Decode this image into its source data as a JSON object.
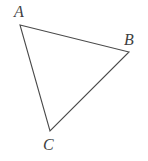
{
  "figure": {
    "kind": "geometry-diagram",
    "shape_name": "triangle",
    "background_color": "#ffffff",
    "stroke_color": "#4a4a4a",
    "stroke_width": 1.1,
    "label_color": "#3f3f3f",
    "canvas": {
      "width": 148,
      "height": 161
    },
    "vertices": [
      {
        "id": "A",
        "label": "A",
        "x": 20,
        "y": 25,
        "label_x": 19,
        "label_y": 13
      },
      {
        "id": "B",
        "label": "B",
        "x": 129,
        "y": 52,
        "label_x": 129,
        "label_y": 41
      },
      {
        "id": "C",
        "label": "C",
        "x": 50,
        "y": 131,
        "label_x": 48,
        "label_y": 146
      }
    ],
    "edges": [
      {
        "id": "AB",
        "from": "A",
        "to": "B"
      },
      {
        "id": "BC",
        "from": "B",
        "to": "C"
      },
      {
        "id": "CA",
        "from": "C",
        "to": "A"
      }
    ],
    "polygon_points": "20,25 129,52 50,131"
  }
}
